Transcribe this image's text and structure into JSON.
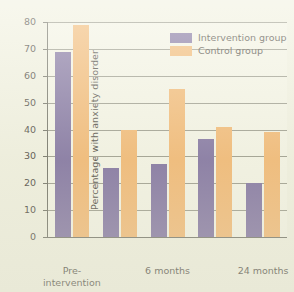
{
  "chart_data": {
    "type": "bar",
    "title": "",
    "xlabel": "",
    "ylabel": "Percentage with anxiety disorder",
    "ylim": [
      0,
      80
    ],
    "yticks": [
      0,
      10,
      20,
      30,
      40,
      50,
      60,
      70,
      80
    ],
    "grid": true,
    "legend_position": "top-right",
    "categories": [
      "Pre-\nintervention",
      "",
      "6 months",
      "",
      "24 months"
    ],
    "tick_labels": [
      "Pre-\nintervention",
      "6 months",
      "24 months"
    ],
    "series": [
      {
        "name": "Intervention group",
        "color": "#6f5f96",
        "values": [
          69,
          25.5,
          27,
          36.5,
          20
        ]
      },
      {
        "name": "Control group",
        "color": "#f0ae62",
        "values": [
          79,
          40,
          55,
          41,
          39
        ]
      }
    ]
  },
  "legend": {
    "items": [
      {
        "label": "Intervention group",
        "swatch": "intervention"
      },
      {
        "label": "Control group",
        "swatch": "control"
      }
    ]
  },
  "axes": {
    "y_title": "Percentage with anxiety disorder",
    "y_tick_labels": [
      "80",
      "70",
      "60",
      "50",
      "40",
      "30",
      "20",
      "10",
      "0"
    ],
    "x_tick_labels": [
      "Pre-\nintervention",
      "6 months",
      "24 months"
    ]
  },
  "colors": {
    "background": "#eeeede",
    "plot_background": "#f2f2e4",
    "axis": "#5c5c52",
    "gridline": "#8e8e80",
    "intervention": "#6f5f96",
    "control": "#f0ae62",
    "text": "#332f2a"
  }
}
